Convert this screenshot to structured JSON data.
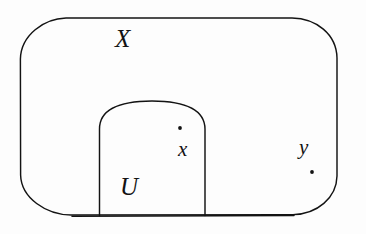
{
  "figure": {
    "type": "set-theory-topology-diagram",
    "background_color": "#fdfdfd",
    "stroke_color": "#131313",
    "stroke_width": 1.4
  },
  "labels": {
    "space": "X",
    "open_set": "U",
    "point_inside": "x",
    "point_outside": "y"
  },
  "shapes": {
    "outer_region": {
      "name": "X",
      "kind": "rounded-rectangle",
      "x": 20,
      "y": 18,
      "width": 317,
      "height": 197,
      "corner_radius": 46
    },
    "inner_region": {
      "name": "U",
      "kind": "arch",
      "left": 99,
      "right": 205,
      "top": 101,
      "bottom": 215,
      "arch_radius": 53
    }
  },
  "points": [
    {
      "name": "x",
      "cx": 180,
      "cy": 128,
      "r": 1.9
    },
    {
      "name": "y",
      "cx": 312,
      "cy": 172,
      "r": 1.9
    }
  ]
}
